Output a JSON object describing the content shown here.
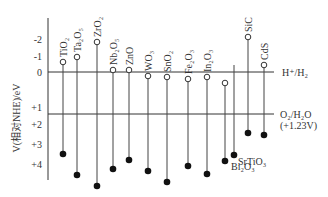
{
  "y_axis": {
    "label": "V(相对NHE)/eV",
    "ticks": [
      {
        "label": "-2",
        "value": -2
      },
      {
        "label": "-1",
        "value": -1
      },
      {
        "label": "0",
        "value": 0
      },
      {
        "label": "+1",
        "value": 1
      },
      {
        "label": "+2",
        "value": 2
      },
      {
        "label": "+3",
        "value": 3
      },
      {
        "label": "+4",
        "value": 4
      }
    ]
  },
  "reference_lines": [
    {
      "label": "H⁺/H₂",
      "value": 0
    },
    {
      "label": "O₂/H₂O",
      "sublabel": "(+1.23V)",
      "value": 1.23
    }
  ],
  "chart_data": {
    "type": "band-diagram",
    "title": "",
    "ylabel": "V(相对NHE)/eV",
    "ylim": [
      -2.5,
      4.5
    ],
    "y_inverted": true,
    "legend": {
      "open_circle": "conduction band edge",
      "filled_circle": "valence band edge"
    },
    "materials": [
      {
        "name": "TiO₂",
        "cb": -0.5,
        "vb": 3.2
      },
      {
        "name": "Ta₂O₅",
        "cb": -0.8,
        "vb": 4.3
      },
      {
        "name": "ZrO₂",
        "cb": -1.6,
        "vb": 4.9
      },
      {
        "name": "Nb₂O₅",
        "cb": -0.1,
        "vb": 3.9
      },
      {
        "name": "ZnO",
        "cb": -0.1,
        "vb": 3.4
      },
      {
        "name": "WO₃",
        "cb": 0.2,
        "vb": 4.0
      },
      {
        "name": "SnO₂",
        "cb": 0.25,
        "vb": 4.6
      },
      {
        "name": "Fe₂O₃",
        "cb": 0.35,
        "vb": 3.8
      },
      {
        "name": "In₂O₃",
        "cb": 0.25,
        "vb": 4.2
      },
      {
        "name": "Bi₂O₃",
        "cb": 0.55,
        "vb": 3.6
      },
      {
        "name": "SrTiO₃",
        "cb": -0.35,
        "vb": 3.2
      },
      {
        "name": "SiC",
        "cb": -1.8,
        "vb": 1.8
      },
      {
        "name": "CdS",
        "cb": -0.4,
        "vb": 1.9
      }
    ]
  }
}
